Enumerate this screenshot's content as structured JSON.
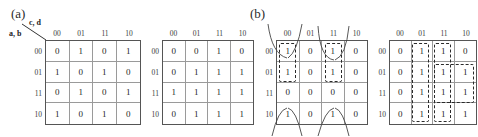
{
  "figure": {
    "panels": [
      {
        "id": "a",
        "label": "(a)"
      },
      {
        "id": "b",
        "label": "(b)"
      }
    ],
    "axis_labels": {
      "columns_var": "c, d",
      "rows_var": "a, b"
    },
    "gray_code": [
      "00",
      "01",
      "11",
      "10"
    ]
  },
  "kmaps": [
    {
      "name": "kmap-1",
      "panel": "a",
      "col_headers": [
        "00",
        "01",
        "11",
        "10"
      ],
      "row_headers": [
        "00",
        "01",
        "11",
        "10"
      ],
      "values": [
        [
          "0",
          "1",
          "0",
          "1"
        ],
        [
          "1",
          "0",
          "1",
          "0"
        ],
        [
          "0",
          "1",
          "0",
          "1"
        ],
        [
          "1",
          "0",
          "1",
          "0"
        ]
      ],
      "groups": []
    },
    {
      "name": "kmap-2",
      "panel": "a",
      "col_headers": [
        "00",
        "01",
        "11",
        "10"
      ],
      "row_headers": [
        "00",
        "01",
        "11",
        "10"
      ],
      "values": [
        [
          "0",
          "0",
          "1",
          "0"
        ],
        [
          "0",
          "1",
          "1",
          "1"
        ],
        [
          "1",
          "1",
          "1",
          "1"
        ],
        [
          "0",
          "1",
          "1",
          "1"
        ]
      ],
      "groups": []
    },
    {
      "name": "kmap-3",
      "panel": "b",
      "col_headers": [
        "00",
        "01",
        "11",
        "10"
      ],
      "row_headers": [
        "00",
        "01",
        "11",
        "10"
      ],
      "values": [
        [
          "1",
          "0",
          "1",
          "0"
        ],
        [
          "1",
          "0",
          "1",
          "0"
        ],
        [
          "0",
          "0",
          "0",
          "0"
        ],
        [
          "1",
          "0",
          "1",
          "0"
        ]
      ],
      "groups": [
        {
          "name": "group-col00-rows00-01",
          "col": 0,
          "row": 0,
          "cols": 1,
          "rows": 2
        },
        {
          "name": "group-col11-rows00-01",
          "col": 2,
          "row": 0,
          "cols": 1,
          "rows": 2
        }
      ]
    },
    {
      "name": "kmap-4",
      "panel": "b",
      "col_headers": [
        "00",
        "01",
        "11",
        "10"
      ],
      "row_headers": [
        "00",
        "01",
        "11",
        "10"
      ],
      "values": [
        [
          "0",
          "1",
          "1",
          "0"
        ],
        [
          "0",
          "1",
          "1",
          "1"
        ],
        [
          "0",
          "1",
          "1",
          "1"
        ],
        [
          "0",
          "1",
          "1",
          "1"
        ]
      ],
      "groups": [
        {
          "name": "group-col01-all-rows",
          "col": 1,
          "row": 0,
          "cols": 1,
          "rows": 4
        },
        {
          "name": "group-col11-all-rows",
          "col": 2,
          "row": 0,
          "cols": 1,
          "rows": 4
        },
        {
          "name": "group-col11-10-rows11-10",
          "col": 2,
          "row": 2,
          "cols": 2,
          "rows": 1
        },
        {
          "name": "group-col11-rows00-01",
          "col": 2,
          "row": 0,
          "cols": 2,
          "rows": 2
        }
      ]
    }
  ]
}
